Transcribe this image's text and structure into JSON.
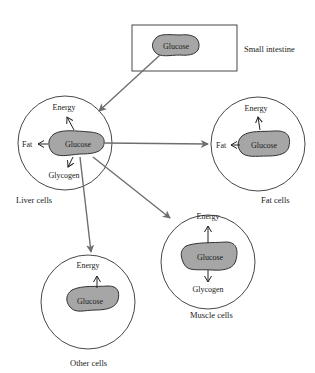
{
  "diagram": {
    "type": "glucose-distribution",
    "colors": {
      "glucose_fill": "#a6a6a6",
      "outline": "#333333",
      "flow_arrow": "#6e6e6e",
      "background": "#ffffff"
    },
    "source": {
      "glucose_label": "Glucose",
      "organ_label": "Small intestine"
    },
    "liver": {
      "glucose_label": "Glucose",
      "energy_label": "Energy",
      "fat_label": "Fat",
      "glycogen_label": "Glycogen",
      "cell_label": "Liver cells"
    },
    "fat": {
      "glucose_label": "Glucose",
      "energy_label": "Energy",
      "fat_label": "Fat",
      "cell_label": "Fat cells"
    },
    "muscle": {
      "glucose_label": "Glucose",
      "energy_label": "Energy",
      "glycogen_label": "Glycogen",
      "cell_label": "Muscle cells"
    },
    "other": {
      "glucose_label": "Glucose",
      "energy_label": "Energy",
      "cell_label": "Other cells"
    }
  }
}
